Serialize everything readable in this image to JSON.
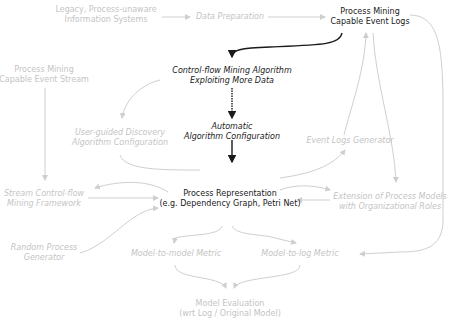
{
  "diagram": {
    "nodes": {
      "legacy": {
        "line1": "Legacy, Process-unaware",
        "line2": "Information Systems"
      },
      "data_prep": {
        "line1": "Data Preparation"
      },
      "event_logs": {
        "line1": "Process Mining",
        "line2": "Capable Event Logs"
      },
      "event_stream": {
        "line1": "Process Mining",
        "line2": "Capable Event Stream"
      },
      "cf_mining": {
        "line1": "Control-flow Mining Algorithm",
        "line2": "Exploiting More Data"
      },
      "user_guided": {
        "line1": "User-guided Discovery",
        "line2": "Algorithm Configuration"
      },
      "auto_config": {
        "line1": "Automatic",
        "line2": "Algorithm Configuration"
      },
      "event_logs_gen": {
        "line1": "Event Logs Generator"
      },
      "stream_cf": {
        "line1": "Stream Control-flow",
        "line2": "Mining Framework"
      },
      "process_repr": {
        "line1": "Process Representation",
        "line2": "(e.g. Dependency Graph, Petri Net)"
      },
      "extension": {
        "line1": "Extension of Process Models",
        "line2": "with Organizational Roles"
      },
      "random_gen": {
        "line1": "Random Process",
        "line2": "Generator"
      },
      "m2m": {
        "line1": "Model-to-model Metric"
      },
      "m2l": {
        "line1": "Model-to-log Metric"
      },
      "evaluation": {
        "line1": "Model Evaluation",
        "line2": "(wrt Log / Original Model)"
      }
    },
    "colors": {
      "faded": "#c4c4c4",
      "dark": "#1a1a1a",
      "edge_faded": "#cfcfcf",
      "edge_dark": "#1a1a1a"
    }
  }
}
